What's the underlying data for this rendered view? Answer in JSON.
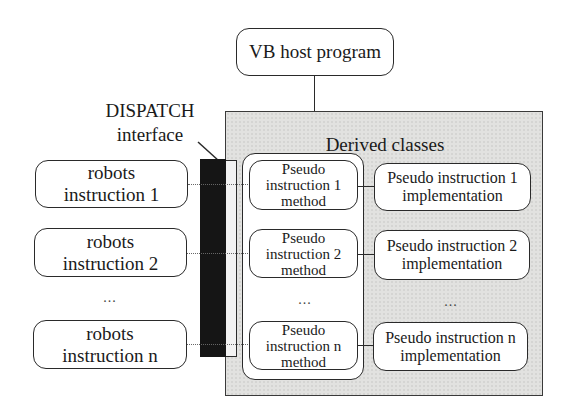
{
  "host": {
    "label": "VB host program"
  },
  "dispatch": {
    "title": "DISPATCH",
    "subtitle": "interface"
  },
  "derived": {
    "title": "Derived classes"
  },
  "robots": [
    {
      "line1": "robots",
      "line2": "instruction 1"
    },
    {
      "line1": "robots",
      "line2": "instruction 2"
    },
    {
      "line1": "robots",
      "line2": "instruction n"
    }
  ],
  "methods": [
    {
      "line1": "Pseudo",
      "line2": "instruction 1",
      "line3": "method"
    },
    {
      "line1": "Pseudo",
      "line2": "instruction 2",
      "line3": "method"
    },
    {
      "line1": "Pseudo",
      "line2": "instruction n",
      "line3": "method"
    }
  ],
  "implementations": [
    {
      "line1": "Pseudo instruction 1",
      "line2": "implementation"
    },
    {
      "line1": "Pseudo instruction 2",
      "line2": "implementation"
    },
    {
      "line1": "Pseudo instruction n",
      "line2": "implementation"
    }
  ],
  "ellipsis": "..."
}
